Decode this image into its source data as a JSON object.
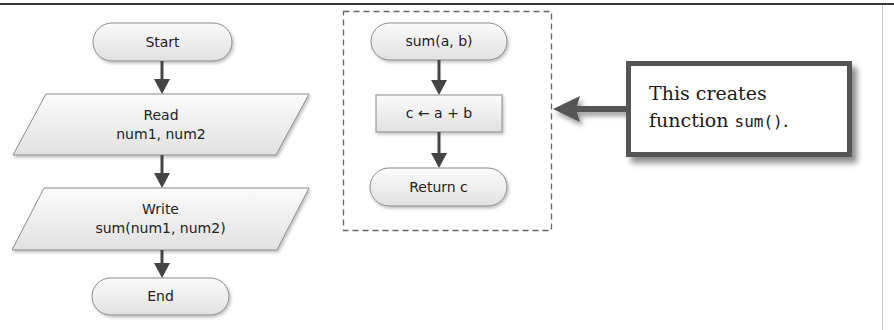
{
  "page": {
    "cutoff_caption": "",
    "colors": {
      "shape_fill_top": "#fafafa",
      "shape_fill_bottom": "#e2e2e2",
      "shape_stroke": "#8a8a8a",
      "arrow": "#444444",
      "dashed_border": "#666666",
      "callout_border": "#555555",
      "text": "#222222"
    }
  },
  "main_flow": {
    "start": {
      "label": "Start"
    },
    "read": {
      "line1": "Read",
      "line2": "num1, num2"
    },
    "write": {
      "line1": "Write",
      "line2": "sum(num1, num2)"
    },
    "end": {
      "label": "End"
    }
  },
  "function_flow": {
    "header": {
      "label": "sum(a, b)"
    },
    "process": {
      "label": "c ← a + b"
    },
    "return": {
      "label": "Return c"
    }
  },
  "callout": {
    "line1": "This creates",
    "line2_prefix": "function ",
    "line2_code": "sum()",
    "line2_suffix": "."
  }
}
